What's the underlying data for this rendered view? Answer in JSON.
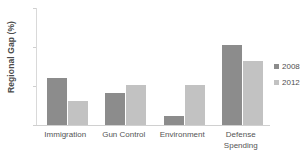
{
  "chart_data": {
    "type": "bar",
    "title": "",
    "xlabel": "",
    "ylabel": "Regional Gap (%)",
    "ylim": [
      0,
      15
    ],
    "yticks": [
      0,
      5,
      10,
      15
    ],
    "ytick_labels": [
      "0",
      "5",
      "10",
      "15"
    ],
    "grid": false,
    "legend_position": "right",
    "categories": [
      "Immigration",
      "Gun Control",
      "Environment",
      "Defense\nSpending"
    ],
    "series": [
      {
        "name": "2008",
        "color": "#8c8c8c",
        "values": [
          6.0,
          4.1,
          1.2,
          10.2
        ]
      },
      {
        "name": "2012",
        "color": "#c2c2c2",
        "values": [
          3.1,
          5.1,
          5.1,
          8.2
        ]
      }
    ]
  },
  "legend": {
    "entries": [
      {
        "label": "2008",
        "color": "#8c8c8c"
      },
      {
        "label": "2012",
        "color": "#c2c2c2"
      }
    ]
  },
  "colors": {
    "series_2008": "#8c8c8c",
    "series_2012": "#c2c2c2",
    "axis": "#d0d0d0",
    "text": "#545454",
    "background": "#ffffff"
  }
}
